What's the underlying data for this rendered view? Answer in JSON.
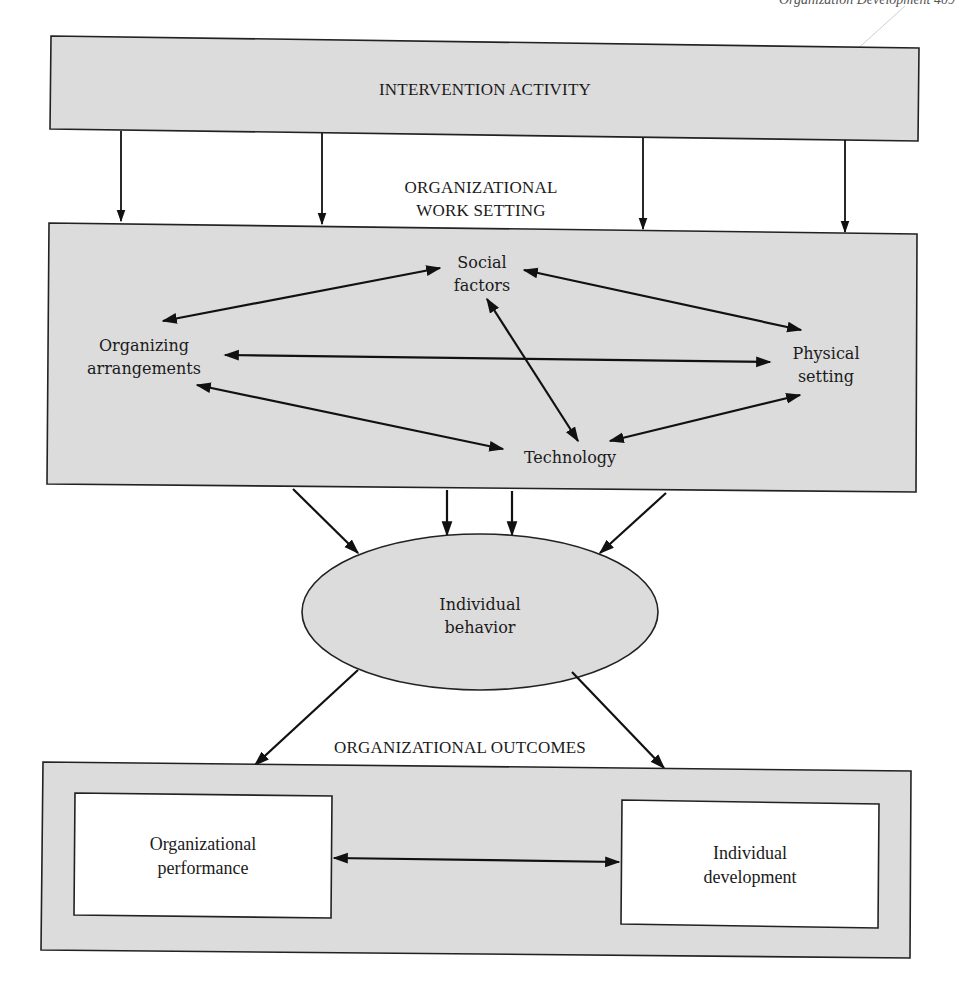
{
  "page_header": {
    "text": "Organization Development   409"
  },
  "diagram": {
    "top_box": {
      "label": "INTERVENTION ACTIVITY"
    },
    "work_setting": {
      "title_line1": "ORGANIZATIONAL",
      "title_line2": "WORK SETTING",
      "nodes": {
        "social_factors": {
          "line1": "Social",
          "line2": "factors"
        },
        "organizing_arrangements": {
          "line1": "Organizing",
          "line2": "arrangements"
        },
        "physical_setting": {
          "line1": "Physical",
          "line2": "setting"
        },
        "technology": {
          "line1": "Technology"
        }
      }
    },
    "individual_behavior": {
      "line1": "Individual",
      "line2": "behavior"
    },
    "outcomes": {
      "title": "ORGANIZATIONAL OUTCOMES",
      "left_box": {
        "line1": "Organizational",
        "line2": "performance"
      },
      "right_box": {
        "line1": "Individual",
        "line2": "development"
      }
    },
    "relationships": [
      {
        "from": "Intervention activity",
        "to": "Organizational work setting",
        "type": "one-way",
        "count": 4
      },
      {
        "from": "Organizing arrangements",
        "to": "Social factors",
        "type": "two-way"
      },
      {
        "from": "Organizing arrangements",
        "to": "Physical setting",
        "type": "two-way"
      },
      {
        "from": "Organizing arrangements",
        "to": "Technology",
        "type": "two-way"
      },
      {
        "from": "Social factors",
        "to": "Physical setting",
        "type": "two-way"
      },
      {
        "from": "Social factors",
        "to": "Technology",
        "type": "two-way"
      },
      {
        "from": "Technology",
        "to": "Physical setting",
        "type": "two-way"
      },
      {
        "from": "Organizational work setting",
        "to": "Individual behavior",
        "type": "one-way",
        "count": 4
      },
      {
        "from": "Individual behavior",
        "to": "Organizational outcomes",
        "type": "one-way",
        "count": 2
      },
      {
        "from": "Organizational performance",
        "to": "Individual development",
        "type": "two-way"
      }
    ],
    "colors": {
      "shaded_fill": "#dcdcdc",
      "line": "#111111",
      "inner_box_fill": "#ffffff"
    }
  }
}
